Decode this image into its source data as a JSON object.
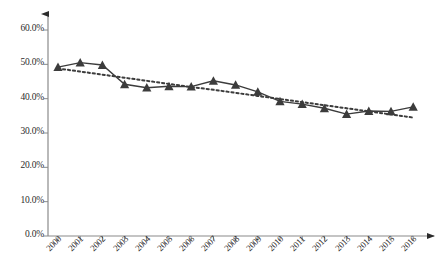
{
  "chart_data": {
    "type": "line",
    "title": "",
    "subtitle": "",
    "xlabel": "",
    "ylabel": "",
    "categories": [
      "2000",
      "2001",
      "2002",
      "2003",
      "2004",
      "2005",
      "2006",
      "2007",
      "2008",
      "2009",
      "2010",
      "2011",
      "2012",
      "2013",
      "2014",
      "2015",
      "2016"
    ],
    "ytick_labels": [
      "0.0%",
      "10.0%",
      "20.0%",
      "30.0%",
      "40.0%",
      "50.0%",
      "60.0%"
    ],
    "ytick_values": [
      0,
      10,
      20,
      30,
      40,
      50,
      60
    ],
    "ylim": [
      0,
      65
    ],
    "grid": false,
    "legend": "none",
    "series": [
      {
        "name": "series-1",
        "style": "solid-line-with-triangle-markers",
        "color": "#3c3c3c",
        "marker": "triangle",
        "values": [
          49.2,
          50.5,
          49.8,
          44.2,
          43.2,
          43.6,
          43.5,
          45.2,
          44.0,
          42.0,
          39.2,
          38.4,
          37.2,
          35.5,
          36.4,
          36.3,
          37.6
        ]
      },
      {
        "name": "trendline",
        "style": "dotted-linear-trendline",
        "color": "#3c3c3c",
        "marker": "none",
        "values": [
          48.8,
          47.9,
          47.0,
          46.1,
          45.2,
          44.3,
          43.4,
          42.6,
          41.7,
          40.8,
          39.9,
          39.0,
          38.1,
          37.2,
          36.3,
          35.4,
          34.5
        ]
      }
    ],
    "axis_color": "#808080",
    "text_color": "#2b2b2b"
  }
}
